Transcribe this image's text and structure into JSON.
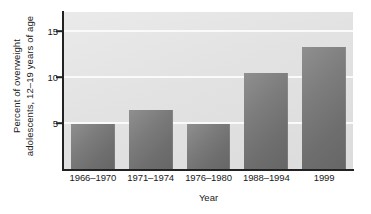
{
  "chart_data": {
    "type": "bar",
    "title": "",
    "subtitle": "",
    "xlabel": "Year",
    "ylabel_line1": "Percent of overweight",
    "ylabel_line2": "adolescents, 12–19 years of age",
    "ylabel": "Percent of overweight adolescents, 12–19 years of age",
    "categories": [
      "1966–1970",
      "1971–1974",
      "1976–1980",
      "1988–1994",
      "1999"
    ],
    "values": [
      4.9,
      6.4,
      4.9,
      10.5,
      13.3
    ],
    "ylim": [
      0,
      17.1
    ],
    "yticks": [
      5,
      10,
      15
    ],
    "ytick_labels": [
      "5",
      "10",
      "15"
    ],
    "grid": true,
    "gridline_color": "#fafafa",
    "legend": "none",
    "series": [
      {
        "name": "Percent of overweight adolescents, 12–19 years of age",
        "values": [
          4.9,
          6.4,
          4.9,
          10.5,
          13.3
        ]
      }
    ],
    "colors": {
      "bar_fill_light": "#8f8f8f",
      "bar_fill_dark": "#666666",
      "plot_background": "#e2e2e2",
      "axis_line": "#222222",
      "text": "#1a1a1a",
      "figure_background": "#ffffff"
    }
  }
}
